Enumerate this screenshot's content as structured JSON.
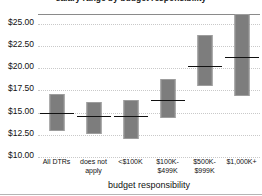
{
  "chart_data": {
    "type": "bar",
    "title": "salary range by budget responsibility",
    "xlabel": "budget responsibility",
    "ylabel": "",
    "ylim": [
      10.0,
      26.0
    ],
    "yticks": [
      10.0,
      12.5,
      15.0,
      17.5,
      20.0,
      22.5,
      25.0
    ],
    "ytick_labels": [
      "$10.00",
      "$12.50",
      "$15.00",
      "$17.50",
      "$20.00",
      "$22.50",
      "$25.00"
    ],
    "grid": true,
    "legend": "none",
    "categories": [
      "All DTRs",
      "does not\napply",
      "<$100K",
      "$100K-\n$499K",
      "$500K-\n$999K",
      "$1,000K+"
    ],
    "series": [
      {
        "name": "range_low",
        "values": [
          12.8,
          12.5,
          11.9,
          14.3,
          17.9,
          16.8
        ]
      },
      {
        "name": "range_high",
        "values": [
          17.0,
          16.1,
          16.3,
          18.7,
          23.6,
          26.0
        ]
      },
      {
        "name": "median",
        "values": [
          14.8,
          14.5,
          14.5,
          16.3,
          20.1,
          21.1
        ]
      }
    ],
    "colors": {
      "bar_fill": "#7d7d7d",
      "bar_border": "#9d9d9d",
      "median_line": "#111111",
      "gridline": "#c9c9c9",
      "axis": "#8a8a8a",
      "background": "#ffffff"
    }
  }
}
